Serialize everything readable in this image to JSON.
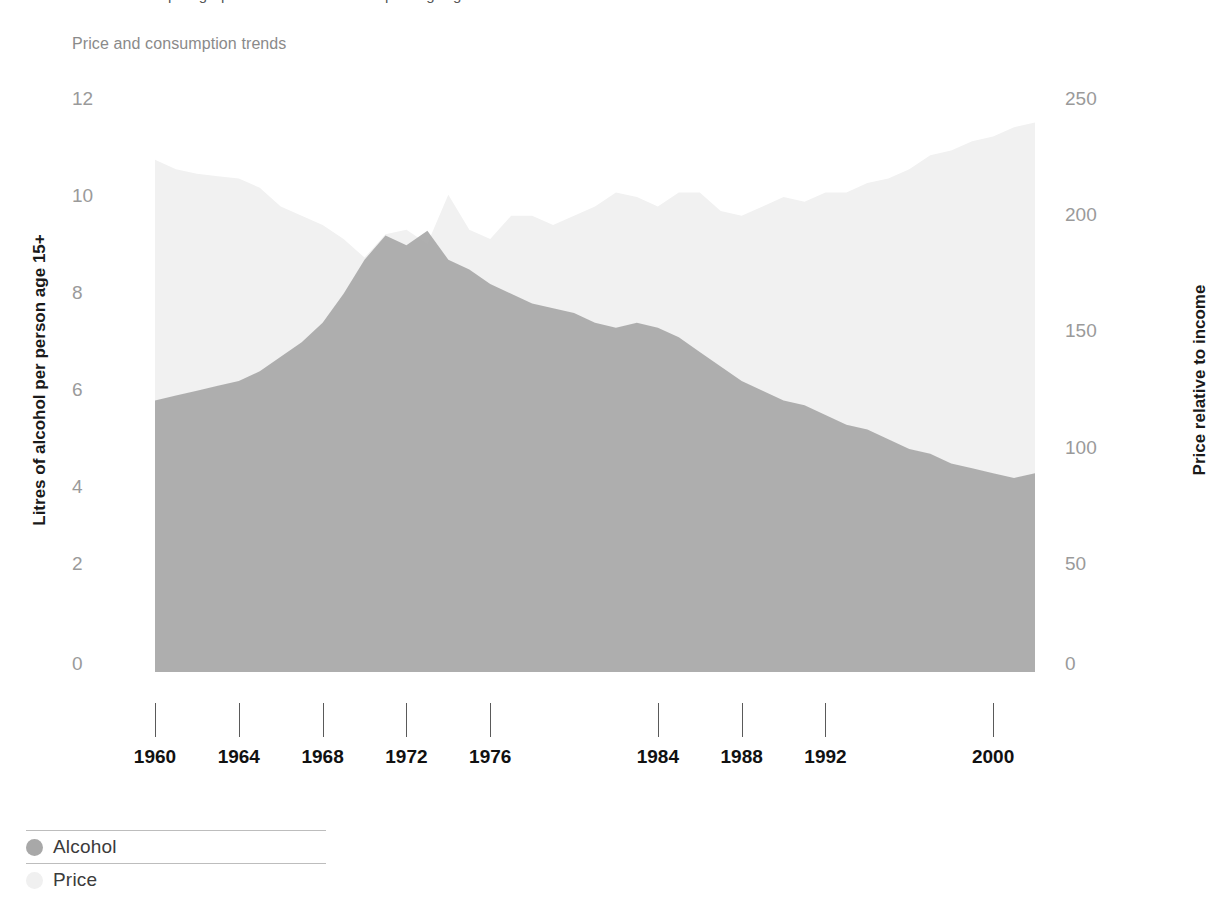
{
  "header": {
    "clipped_top_text": "a paragraph continues above the plotting region",
    "subtitle": "Price and consumption trends"
  },
  "axes": {
    "left_title": "Litres of alcohol per person age 15+",
    "right_title": "Price relative to income",
    "left_ticks": [
      "0",
      "2",
      "4",
      "6",
      "8",
      "10",
      "12"
    ],
    "right_ticks": [
      "0",
      "50",
      "100",
      "150",
      "200",
      "250"
    ],
    "x_ticks": [
      "1960",
      "1964",
      "1968",
      "1972",
      "1976",
      "1984",
      "1988",
      "1992",
      "2000"
    ]
  },
  "legend": {
    "items": [
      {
        "label": "Alcohol",
        "color": "#a8a8a8"
      },
      {
        "label": "Price",
        "color": "#f0f0f0"
      }
    ]
  },
  "colors": {
    "alcohol_area": "#a8a8a8",
    "price_area": "#f1f1f1",
    "overlap_area": "#b5b5b5",
    "tick_text": "#9a9a9a",
    "axis_title": "#1a1a1a",
    "background": "#ffffff"
  },
  "chart_data": {
    "type": "area",
    "title": "",
    "subtitle": "Price and consumption trends",
    "xlabel": "",
    "ylabel": "Litres of alcohol per person age 15+",
    "y2label": "Price relative to income",
    "xlim": [
      1960,
      2002
    ],
    "ylim": [
      0,
      12
    ],
    "y2lim": [
      0,
      250
    ],
    "grid": false,
    "legend_position": "bottom-left",
    "x": [
      1960,
      1961,
      1962,
      1963,
      1964,
      1965,
      1966,
      1967,
      1968,
      1969,
      1970,
      1971,
      1972,
      1973,
      1974,
      1975,
      1976,
      1977,
      1978,
      1979,
      1980,
      1981,
      1982,
      1983,
      1984,
      1985,
      1986,
      1987,
      1988,
      1989,
      1990,
      1991,
      1992,
      1993,
      1994,
      1995,
      1996,
      1997,
      1998,
      1999,
      2000,
      2001,
      2002
    ],
    "series": [
      {
        "name": "Alcohol",
        "axis": "left",
        "unit": "litres per person age 15+",
        "color": "#a8a8a8",
        "values": [
          5.6,
          5.7,
          5.8,
          5.9,
          6.0,
          6.2,
          6.5,
          6.8,
          7.2,
          7.8,
          8.5,
          9.0,
          8.8,
          9.1,
          8.5,
          8.3,
          8.0,
          7.8,
          7.6,
          7.5,
          7.4,
          7.2,
          7.1,
          7.2,
          7.1,
          6.9,
          6.6,
          6.3,
          6.0,
          5.8,
          5.6,
          5.5,
          5.3,
          5.1,
          5.0,
          4.8,
          4.6,
          4.5,
          4.3,
          4.2,
          4.1,
          4.0,
          4.1
        ]
      },
      {
        "name": "Price",
        "axis": "right",
        "unit": "index, price relative to income",
        "color": "#f1f1f1",
        "values": [
          220,
          216,
          214,
          213,
          212,
          208,
          200,
          196,
          192,
          186,
          178,
          188,
          190,
          184,
          205,
          190,
          186,
          196,
          196,
          192,
          196,
          200,
          206,
          204,
          200,
          206,
          206,
          198,
          196,
          200,
          204,
          202,
          206,
          206,
          210,
          212,
          216,
          222,
          224,
          228,
          230,
          234,
          236
        ]
      }
    ]
  }
}
